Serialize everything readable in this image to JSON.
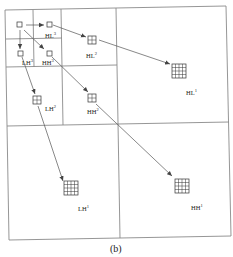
{
  "figure": {
    "caption": "(b)",
    "subbands": [
      {
        "id": "HL3",
        "name": "HL",
        "level": "3"
      },
      {
        "id": "LH3",
        "name": "LH",
        "level": "3"
      },
      {
        "id": "HH3",
        "name": "HH",
        "level": "3"
      },
      {
        "id": "HL2",
        "name": "HL",
        "level": "2"
      },
      {
        "id": "LH2",
        "name": "LH",
        "level": "2"
      },
      {
        "id": "HH2",
        "name": "HH",
        "level": "2"
      },
      {
        "id": "HL1",
        "name": "HL",
        "level": "1"
      },
      {
        "id": "LH1",
        "name": "LH",
        "level": "1"
      },
      {
        "id": "HH1",
        "name": "HH",
        "level": "1"
      }
    ],
    "blocks": {
      "level3": "1x1",
      "level2": "2x2",
      "level1": "4x4"
    },
    "arrows": [
      {
        "from": "LL3",
        "to": "HL3"
      },
      {
        "from": "LL3",
        "to": "LH3"
      },
      {
        "from": "LL3",
        "to": "HH3"
      },
      {
        "from": "HL3",
        "to": "HL2"
      },
      {
        "from": "LH3",
        "to": "LH2"
      },
      {
        "from": "HH3",
        "to": "HH2"
      },
      {
        "from": "HL2",
        "to": "HL1"
      },
      {
        "from": "LH2",
        "to": "LH1"
      },
      {
        "from": "HH2",
        "to": "HH1"
      }
    ],
    "colors": {
      "frame": "#8a8a8a",
      "arrow": "#555555",
      "cell": "#333333",
      "text": "#222222"
    }
  }
}
